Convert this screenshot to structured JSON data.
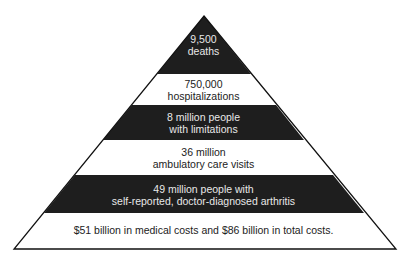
{
  "diagram": {
    "type": "pyramid",
    "colors": {
      "dark": "#1e1e1e",
      "light": "#ffffff",
      "outline": "#111111"
    },
    "tiers": [
      {
        "line1": "9,500",
        "line2": "deaths",
        "fill": "dark"
      },
      {
        "line1": "750,000",
        "line2": "hospitalizations",
        "fill": "light"
      },
      {
        "line1": "8 million people",
        "line2": "with limitations",
        "fill": "dark"
      },
      {
        "line1": "36 million",
        "line2": "ambulatory care visits",
        "fill": "light"
      },
      {
        "line1": "49 million people with",
        "line2": "self-reported, doctor-diagnosed arthritis",
        "fill": "dark"
      },
      {
        "line1": "$51 billion in medical costs and $86 billion in total costs.",
        "line2": "",
        "fill": "light"
      }
    ]
  }
}
